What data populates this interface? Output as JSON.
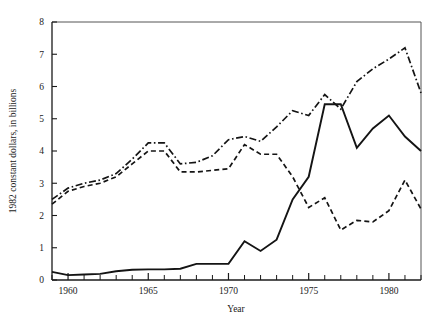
{
  "chart_data": {
    "type": "line",
    "title": "",
    "xlabel": "Year",
    "ylabel": "1982 constant dollars, in billions",
    "xlim": [
      1959,
      1982
    ],
    "ylim": [
      0,
      8
    ],
    "yticks": [
      0,
      1,
      2,
      3,
      4,
      5,
      6,
      7,
      8
    ],
    "ytick_labels": [
      "0",
      "1",
      "2",
      "3",
      "4",
      "5",
      "6",
      "7",
      "8"
    ],
    "xticks": [
      1960,
      1965,
      1970,
      1975,
      1980
    ],
    "xtick_labels": [
      "1960",
      "1965",
      "1970",
      "1975",
      "1980"
    ],
    "x_minor_tick_interval": 1,
    "grid": false,
    "legend": "none",
    "x": [
      1959,
      1960,
      1961,
      1962,
      1963,
      1964,
      1965,
      1966,
      1967,
      1968,
      1969,
      1970,
      1971,
      1972,
      1973,
      1974,
      1975,
      1976,
      1977,
      1978,
      1979,
      1980,
      1981,
      1982
    ],
    "series": [
      {
        "name": "dash-dot-series",
        "style": "dash-dot",
        "color": "#141414",
        "values": [
          2.5,
          2.85,
          3.0,
          3.1,
          3.3,
          3.75,
          4.25,
          4.25,
          3.6,
          3.65,
          3.85,
          4.35,
          4.45,
          4.3,
          4.75,
          5.25,
          5.1,
          5.75,
          5.3,
          6.15,
          6.55,
          6.85,
          7.2,
          5.8
        ]
      },
      {
        "name": "dashed-series",
        "style": "dashed",
        "color": "#141414",
        "values": [
          2.35,
          2.75,
          2.9,
          3.0,
          3.2,
          3.6,
          4.0,
          4.0,
          3.35,
          3.35,
          3.4,
          3.45,
          4.2,
          3.9,
          3.9,
          3.2,
          2.25,
          2.55,
          1.55,
          1.85,
          1.8,
          2.15,
          3.1,
          2.2
        ]
      },
      {
        "name": "solid-series",
        "style": "solid",
        "color": "#141414",
        "values": [
          0.25,
          0.15,
          0.17,
          0.19,
          0.27,
          0.32,
          0.33,
          0.33,
          0.35,
          0.5,
          0.5,
          0.5,
          1.2,
          0.9,
          1.25,
          2.5,
          3.2,
          5.45,
          5.45,
          4.1,
          4.7,
          5.1,
          4.45,
          4.0
        ]
      }
    ]
  }
}
